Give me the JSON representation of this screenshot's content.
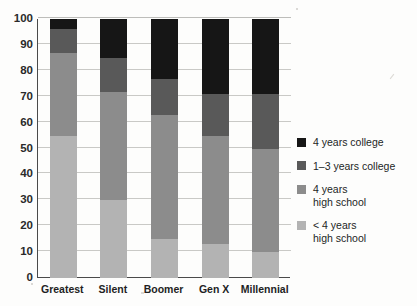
{
  "chart_data": {
    "type": "bar",
    "subtype": "stacked-bar-100-percent",
    "title": "",
    "xlabel": "",
    "ylabel": "",
    "ylim": [
      0,
      100
    ],
    "yticks": [
      0,
      10,
      20,
      30,
      40,
      50,
      60,
      70,
      80,
      90,
      100
    ],
    "grid": true,
    "grid_axis": "y",
    "legend_position": "right",
    "categories": [
      "Greatest",
      "Silent",
      "Boomer",
      "Gen X",
      "Millennial"
    ],
    "series": [
      {
        "name": "< 4 years high school",
        "color": "#b3b3b3",
        "values": [
          55,
          30,
          15,
          13,
          10
        ]
      },
      {
        "name": "4 years high school",
        "color": "#8c8c8c",
        "values": [
          32,
          42,
          48,
          42,
          40
        ]
      },
      {
        "name": "1–3 years college",
        "color": "#595959",
        "values": [
          9,
          13,
          14,
          16,
          21
        ]
      },
      {
        "name": "4 years college",
        "color": "#161616",
        "values": [
          4,
          15,
          23,
          29,
          29
        ]
      }
    ],
    "cumulative_tops": {
      "Greatest": [
        55,
        87,
        96,
        100
      ],
      "Silent": [
        30,
        72,
        85,
        100
      ],
      "Boomer": [
        15,
        63,
        77,
        100
      ],
      "Gen X": [
        13,
        55,
        71,
        100
      ],
      "Millennial": [
        10,
        50,
        71,
        100
      ]
    }
  },
  "axis": {
    "y_tick_labels": [
      "100",
      "90",
      "80",
      "70",
      "60",
      "50",
      "40",
      "30",
      "20",
      "10",
      "0"
    ],
    "x_tick_labels": [
      "Greatest",
      "Silent",
      "Boomer",
      "Gen X",
      "Millennial"
    ]
  },
  "legend": {
    "items": [
      {
        "label_line1": "4 years college",
        "label_line2": "",
        "color": "#161616"
      },
      {
        "label_line1": "1–3 years college",
        "label_line2": "",
        "color": "#595959"
      },
      {
        "label_line1": "4 years",
        "label_line2": "high school",
        "color": "#8c8c8c"
      },
      {
        "label_line1": "< 4 years",
        "label_line2": "high school",
        "color": "#b3b3b3"
      }
    ]
  },
  "colors": {
    "axis": "#4a4a4a",
    "grid": "#c9c9c6",
    "background": "#fdfdfc",
    "text": "#231f1f"
  }
}
